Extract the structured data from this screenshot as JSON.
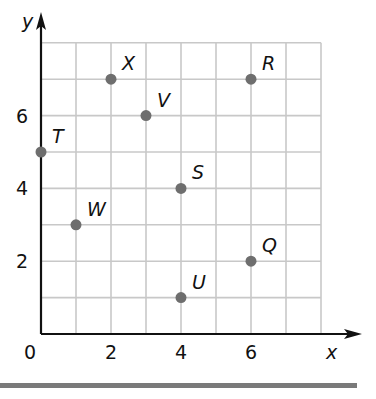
{
  "chart_data": {
    "type": "scatter",
    "title": "",
    "xlabel": "x",
    "ylabel": "y",
    "xlim": [
      0,
      8
    ],
    "ylim": [
      0,
      8
    ],
    "grid": true,
    "grid_step": 1,
    "x_ticks": [
      0,
      2,
      4,
      6
    ],
    "y_ticks": [
      2,
      4,
      6
    ],
    "origin_label": "0",
    "points": [
      {
        "label": "X",
        "x": 2,
        "y": 7
      },
      {
        "label": "R",
        "x": 6,
        "y": 7
      },
      {
        "label": "V",
        "x": 3,
        "y": 6
      },
      {
        "label": "T",
        "x": 0,
        "y": 5
      },
      {
        "label": "S",
        "x": 4,
        "y": 4
      },
      {
        "label": "W",
        "x": 1,
        "y": 3
      },
      {
        "label": "Q",
        "x": 6,
        "y": 2
      },
      {
        "label": "U",
        "x": 4,
        "y": 1
      }
    ],
    "colors": {
      "grid": "#c8c8c8",
      "axis": "#111111",
      "point": "#6e6e6e",
      "rule": "#7a7a7a"
    }
  }
}
